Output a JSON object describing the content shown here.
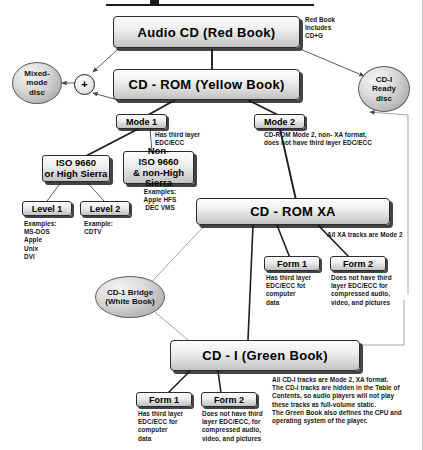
{
  "diagram": {
    "colors": {
      "box_fill": "#e6e6e6",
      "box_border": "#2b2b2b",
      "shadow": "#141414",
      "oval_fill": "#c8c8c8",
      "line": "#1f1f1f",
      "text": "#111111"
    },
    "nodes": {
      "audio_cd": "Audio CD (Red Book)",
      "cd_rom": "CD - ROM (Yellow Book)",
      "cd_rom_xa": "CD - ROM  XA",
      "cd_i": "CD - I (Green Book)",
      "mode1": "Mode 1",
      "mode2": "Mode 2",
      "iso9660": "ISO 9660\nor High Sierra",
      "non_iso9660": "Non-\nISO 9660\n& non-High Sierra",
      "level1": "Level 1",
      "level2": "Level 2",
      "xa_form1": "Form 1",
      "xa_form2": "Form 2",
      "cdi_form1": "Form 1",
      "cdi_form2": "Form 2"
    },
    "ovals": {
      "mixed_mode": "Mixed-\nmode\ndisc",
      "cdi_ready": "CD-I\nReady\ndisc",
      "cdi_bridge": "CD-1 Bridge\n(White Book)"
    },
    "junction": {
      "plus": "+"
    },
    "notes": {
      "red_book": "Red Book\nIncludes\nCD+G",
      "mode1_note": "Has third layer\nEDC/ECC",
      "mode2_note": "CD-ROM Mode 2, non- XA format,\ndoes not have third layer EDC/ECC",
      "non_iso_examples": "Examples:\nApple HFS\nDEC VMS",
      "level1_examples": "Examples:\n   MS-DOS\n   Apple\n   Unix\n   DVI",
      "level2_examples": "Example:\n   CDTV",
      "xa_tracks": "All XA tracks are Mode 2",
      "xa_form1_note": "Has third layer\nEDC/ECC fot\ncomputer\ndata",
      "xa_form2_note": "Does not have third\nlayer EDC/ECC for\ncompressed audio,\nvideo, and pictures",
      "cdi_form1_note": "Has third layer\nEDC/ECC for\ncomputer\ndata",
      "cdi_form2_note": "Does not have third\nlayer EDC/ECC, for\ncompressed audio,\nvideo, and pictures",
      "cdi_summary": "All CD-I tracks are Mode 2, XA format.\nThe CD-I tracks are hidden in the Table of\nContents, so audio players will not play\nthese tracks as full-volume static.\nThe Green Book also defines the CPU and\noperating system of the player."
    }
  }
}
